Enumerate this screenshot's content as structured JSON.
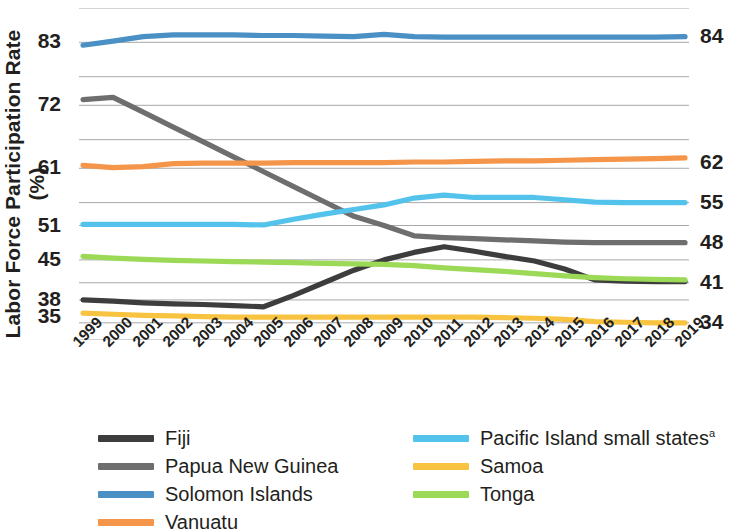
{
  "axis": {
    "y_title": "Labor Force Participation Rate (%)",
    "y_ticks_left": [
      "83",
      "72",
      "61",
      "51",
      "45",
      "38",
      "35"
    ],
    "y_ticks_right": [
      "84",
      "62",
      "55",
      "48",
      "41",
      "34"
    ],
    "x_ticks": [
      "1999",
      "2000",
      "2001",
      "2002",
      "2003",
      "2004",
      "2005",
      "2006",
      "2007",
      "2008",
      "2009",
      "2010",
      "2011",
      "2012",
      "2013",
      "2014",
      "2015",
      "2016",
      "2017",
      "2018",
      "2019"
    ]
  },
  "legend": {
    "column1": [
      {
        "label": "Fiji",
        "color": "#3d3d3d"
      },
      {
        "label": "Papua New Guinea",
        "color": "#6e6e6e"
      },
      {
        "label": "Solomon Islands",
        "color": "#4a90c4"
      },
      {
        "label": "Vanuatu",
        "color": "#f4954a"
      }
    ],
    "column2": [
      {
        "label": "Pacific Island small states",
        "sup": "a",
        "color": "#54c3ec"
      },
      {
        "label": "Samoa",
        "color": "#f7c340"
      },
      {
        "label": "Tonga",
        "color": "#9bd957"
      }
    ]
  },
  "colors": {
    "fiji": "#3d3d3d",
    "papua_new_guinea": "#6e6e6e",
    "solomon_islands": "#4a90c4",
    "vanuatu": "#f4954a",
    "pacific_island_small_states": "#54c3ec",
    "samoa": "#f7c340",
    "tonga": "#9bd957",
    "gridline": "#a8a8a8",
    "text": "#231f20"
  },
  "chart_data": {
    "type": "line",
    "title": "",
    "xlabel": "",
    "ylabel": "Labor Force Participation Rate (%)",
    "x": [
      "1999",
      "2000",
      "2001",
      "2002",
      "2003",
      "2004",
      "2005",
      "2006",
      "2007",
      "2008",
      "2009",
      "2010",
      "2011",
      "2012",
      "2013",
      "2014",
      "2015",
      "2016",
      "2017",
      "2018",
      "2019"
    ],
    "ylim": [
      31,
      89
    ],
    "grid": true,
    "gridline_values": [
      89,
      83,
      77,
      72,
      66,
      61,
      55,
      51,
      45,
      41,
      38,
      34,
      31
    ],
    "y_axis_tick_values_left": [
      83,
      72,
      61,
      51,
      45,
      38,
      35
    ],
    "y_axis_tick_values_right": [
      84,
      62,
      55,
      48,
      41,
      34
    ],
    "legend_position": "bottom",
    "series": [
      {
        "name": "Fiji",
        "color": "#3d3d3d",
        "end_label": "41",
        "values": [
          38.0,
          37.8,
          37.5,
          37.3,
          37.2,
          37.0,
          36.8,
          38.8,
          41.0,
          43.2,
          45.0,
          46.3,
          47.3,
          46.5,
          45.6,
          44.8,
          43.4,
          41.5,
          41.3,
          41.2,
          41.2
        ]
      },
      {
        "name": "Papua New Guinea",
        "color": "#6e6e6e",
        "end_label": "48",
        "values": [
          73.0,
          73.4,
          70.8,
          68.2,
          65.6,
          63.0,
          60.4,
          57.8,
          55.2,
          52.6,
          51.0,
          49.2,
          48.9,
          48.7,
          48.5,
          48.3,
          48.1,
          48.0,
          48.0,
          48.0,
          48.0
        ]
      },
      {
        "name": "Solomon Islands",
        "color": "#4a90c4",
        "end_label": "84",
        "values": [
          82.5,
          83.2,
          84.0,
          84.3,
          84.3,
          84.3,
          84.2,
          84.2,
          84.1,
          84.0,
          84.4,
          84.0,
          83.9,
          83.9,
          83.9,
          83.9,
          83.9,
          83.9,
          83.9,
          83.9,
          84.0
        ]
      },
      {
        "name": "Vanuatu",
        "color": "#f4954a",
        "end_label": "62",
        "values": [
          61.5,
          61.1,
          61.3,
          61.8,
          61.9,
          61.9,
          61.9,
          62.0,
          62.0,
          62.0,
          62.0,
          62.1,
          62.1,
          62.2,
          62.3,
          62.3,
          62.4,
          62.5,
          62.6,
          62.7,
          62.8
        ]
      },
      {
        "name": "Pacific Island small states",
        "color": "#54c3ec",
        "end_label": "55",
        "values": [
          51.2,
          51.2,
          51.2,
          51.2,
          51.2,
          51.2,
          51.1,
          52.1,
          53.0,
          53.8,
          54.6,
          55.8,
          56.3,
          55.9,
          55.9,
          55.9,
          55.5,
          55.1,
          55.0,
          55.0,
          55.0
        ]
      },
      {
        "name": "Samoa",
        "color": "#f7c340",
        "end_label": "34",
        "values": [
          35.7,
          35.5,
          35.3,
          35.2,
          35.1,
          35.0,
          35.0,
          35.0,
          35.0,
          35.0,
          35.0,
          35.0,
          35.0,
          35.0,
          34.9,
          34.8,
          34.6,
          34.2,
          34.1,
          34.0,
          34.0
        ]
      },
      {
        "name": "Tonga",
        "color": "#9bd957",
        "end_label": "",
        "values": [
          45.6,
          45.3,
          45.1,
          44.9,
          44.8,
          44.7,
          44.6,
          44.5,
          44.4,
          44.3,
          44.2,
          44.0,
          43.6,
          43.3,
          43.0,
          42.6,
          42.2,
          41.9,
          41.7,
          41.6,
          41.5
        ]
      }
    ]
  }
}
